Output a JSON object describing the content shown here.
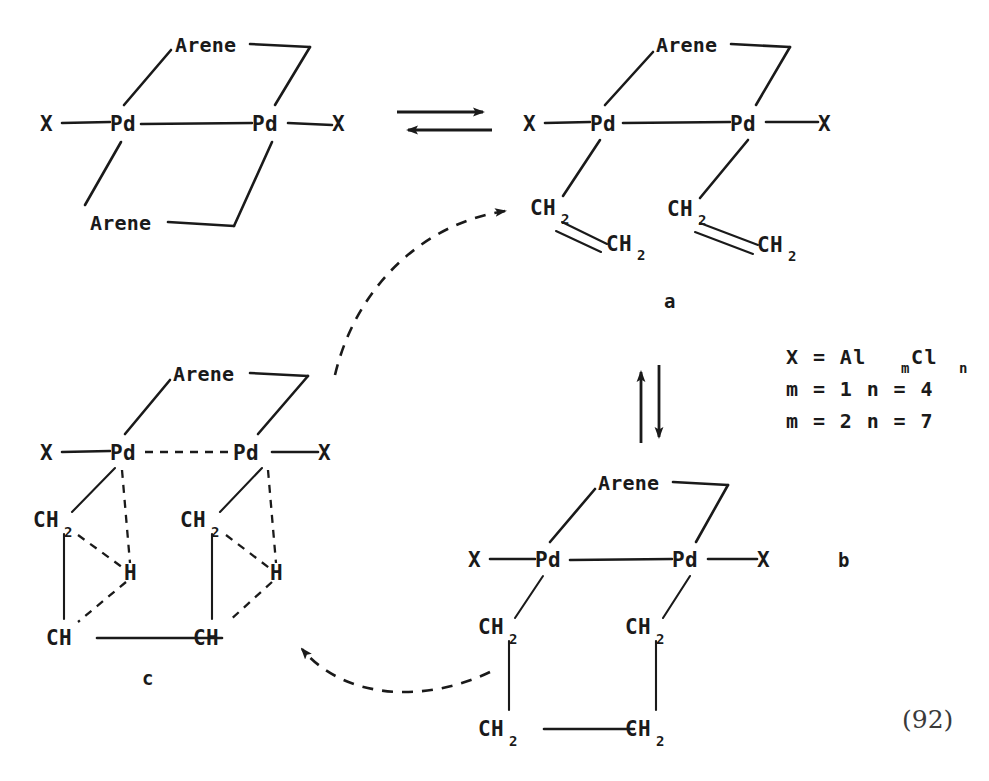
{
  "diagram": {
    "reference_number": "(92)",
    "ink_color": "#1a1a1a",
    "background_color": "#ffffff"
  },
  "labels": {
    "arene": "Arene",
    "pd": "Pd",
    "x": "X",
    "ch2": "CH",
    "ch2_sub": "2",
    "ch": "CH",
    "h": "H"
  },
  "structure_labels": {
    "a": "a",
    "b": "b",
    "c": "c"
  },
  "formula_block": {
    "line1_lhs": "X  =  Al",
    "line1_sub1": "m",
    "line1_mid": "Cl",
    "line1_sub2": "n",
    "line2": "m = 1 n = 4",
    "line3": "m = 2 n = 7"
  },
  "reactant": {
    "name": "bis-arene dipalladium dication",
    "atoms": {
      "x_left": "X",
      "pd_left": "Pd",
      "pd_right": "Pd",
      "x_right": "X",
      "arene_top": "Arene",
      "arene_bottom": "Arene"
    }
  },
  "structure_a": {
    "name": "arene-bridged dipalladium bis-ethylene complex",
    "atoms": {
      "x_left": "X",
      "pd_left": "Pd",
      "pd_right": "Pd",
      "x_right": "X",
      "arene_top": "Arene",
      "ethylene_1_c1": "CH",
      "ethylene_1_c1_sub": "2",
      "ethylene_1_c2": "CH",
      "ethylene_1_c2_sub": "2",
      "ethylene_2_c1": "CH",
      "ethylene_2_c1_sub": "2",
      "ethylene_2_c2": "CH",
      "ethylene_2_c2_sub": "2"
    }
  },
  "structure_b": {
    "name": "dipalladacyclic tetramethylene complex",
    "atoms": {
      "x_left": "X",
      "pd_left": "Pd",
      "pd_right": "Pd",
      "x_right": "X",
      "arene_top": "Arene",
      "ch2_upper_left": "CH",
      "ch2_upper_left_sub": "2",
      "ch2_upper_right": "CH",
      "ch2_upper_right_sub": "2",
      "ch2_lower_left": "CH",
      "ch2_lower_left_sub": "2",
      "ch2_lower_right": "CH",
      "ch2_lower_right_sub": "2"
    }
  },
  "structure_c": {
    "name": "agostic hydride bridged dipalladium complex",
    "atoms": {
      "x_left": "X",
      "pd_left": "Pd",
      "pd_right": "Pd",
      "x_right": "X",
      "arene_top": "Arene",
      "ch2_left": "CH",
      "ch2_left_sub": "2",
      "ch2_right": "CH",
      "ch2_right_sub": "2",
      "h_left": "H",
      "h_right": "H",
      "ch_left": "CH",
      "ch_right": "CH"
    }
  },
  "arrows": {
    "horizontal_equilibrium": "forward-and-reverse equilibrium arrows",
    "vertical_equilibrium": "up-and-down equilibrium arrows",
    "curve_c_to_a": "dashed curved arrow from structure c to structure a",
    "curve_b_to_c": "dashed curved arrow from structure b to structure c"
  }
}
